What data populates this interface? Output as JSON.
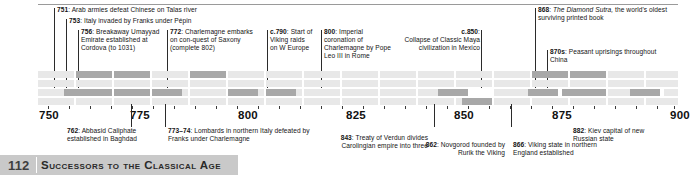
{
  "timeline": {
    "axis": {
      "ticks": [
        750,
        755,
        760,
        765,
        770,
        775,
        780,
        785,
        790,
        795,
        800,
        805,
        810,
        815,
        820,
        825,
        830,
        835,
        840,
        845,
        850,
        855,
        860,
        865,
        870,
        875,
        880,
        885,
        890,
        895,
        900
      ],
      "labeled_years": [
        "750",
        "775",
        "800",
        "825",
        "850",
        "875",
        "900"
      ],
      "range": [
        745,
        902
      ]
    },
    "events_above": [
      {
        "year_label": "751",
        "text": "Arab armies defeat Chinese on Talas river",
        "align": "left"
      },
      {
        "year_label": "753",
        "text": "Italy invaded by Franks under Pépin",
        "align": "left"
      },
      {
        "year_label": "756",
        "text": "Breakaway Umayyad Emirate established at Cordova (to 1031)",
        "align": "left"
      },
      {
        "year_label": "772",
        "text": "Charlemagne embarks on con-quest of Saxony (complete 802)",
        "align": "left"
      },
      {
        "year_label": "c.790",
        "text": "Start of Viking raids on W Europe",
        "align": "left"
      },
      {
        "year_label": "800",
        "text": "Imperial coronation of Charlemagne by Pope Leo III in Rome",
        "align": "left"
      },
      {
        "year_label": "c.850",
        "text": "Collapse of Classic Maya civilization in Mexico",
        "align": "right"
      },
      {
        "year_label": "868",
        "text": "The Diamond Sutra, the world's oldest surviving printed book",
        "italic_part": "The Diamond Sutra,",
        "rest": " the world's oldest surviving printed book",
        "align": "left"
      },
      {
        "year_label": "870s",
        "text": "Peasant uprisings throughout China",
        "align": "left"
      }
    ],
    "events_below": [
      {
        "year_label": "762",
        "text": "Abbasid Caliphate established in Baghdad",
        "align": "left"
      },
      {
        "year_label": "773–74",
        "text": "Lombards in northern Italy defeated by Franks under Charlemagne",
        "align": "left"
      },
      {
        "year_label": "843",
        "text": "Treaty of Verdun divides Carolingian empire into three",
        "align": "right"
      },
      {
        "year_label": "862",
        "text": "Novgorod founded by Rurik the Viking",
        "align": "right"
      },
      {
        "year_label": "866",
        "text": "Viking state in northern England established",
        "align": "left"
      },
      {
        "year_label": "882",
        "text": "Kiev capital of new Russian state",
        "align": "left"
      }
    ]
  },
  "footer": {
    "page_number": "112",
    "chapter_title": "Successors to the Classical Age"
  },
  "colors": {
    "cell_base": "#e8e8e8",
    "cell_highlight": "#a8a8a8",
    "footer_bg": "#c9c9c9",
    "rule": "#9a9a9a",
    "text": "#141414"
  }
}
